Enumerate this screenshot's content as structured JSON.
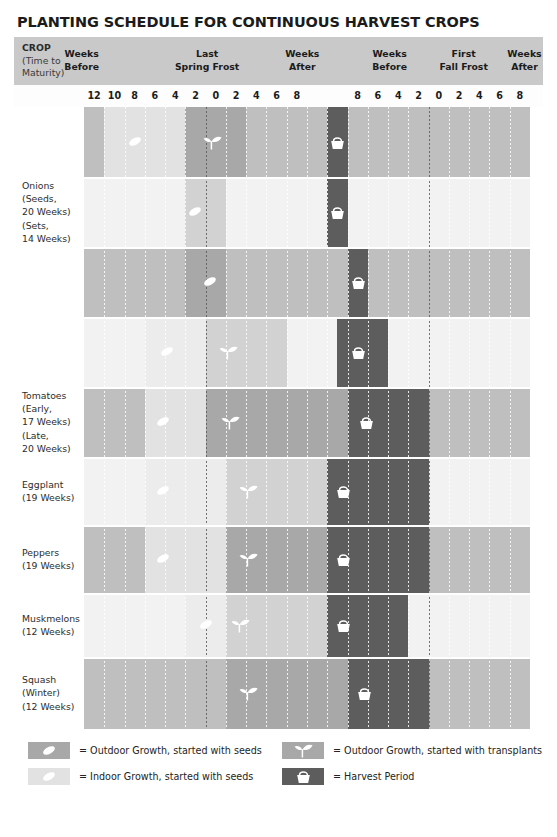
{
  "title": "PLANTING SCHEDULE FOR CONTINUOUS HARVEST CROPS",
  "header": {
    "crop_label": "CROP",
    "crop_sub1": "(Time to",
    "crop_sub2": "Maturity)",
    "groups": [
      {
        "line1": "Weeks",
        "line2": "Before",
        "center_pct": 12.8
      },
      {
        "line1": "Last",
        "line2": "Spring Frost",
        "center_pct": 36.5
      },
      {
        "line1": "Weeks",
        "line2": "After",
        "center_pct": 54.5
      },
      {
        "line1": "Weeks",
        "line2": "Before",
        "center_pct": 71.0
      },
      {
        "line1": "First",
        "line2": "Fall Frost",
        "center_pct": 85.0
      },
      {
        "line1": "Weeks",
        "line2": "After",
        "center_pct": 96.5
      }
    ]
  },
  "axis": {
    "ticks": [
      "12",
      "10",
      "8",
      "6",
      "4",
      "2",
      "0",
      "2",
      "4",
      "6",
      "8",
      "",
      "",
      "8",
      "6",
      "4",
      "2",
      "0",
      "2",
      "4",
      "6",
      "8"
    ],
    "n_columns": 22,
    "frost_columns": [
      6,
      17
    ],
    "frost_labels": [
      "Last Spring Frost",
      "First Fall Frost"
    ]
  },
  "colors": {
    "header_band": "#c9c9c9",
    "base_dark": "#bfbfbf",
    "base_light": "#f2f2f2",
    "outdoor_seeds_dark": "#a8a8a8",
    "outdoor_seeds_light": "#d2d2d2",
    "indoor_seeds_dark": "#e2e2e2",
    "indoor_seeds_light": "#ececec",
    "harvest": "#5d5d5d",
    "text": "#2c2c2c"
  },
  "legend": {
    "items": [
      {
        "swatch": "outdoor-seeds",
        "icon": "seed-icon",
        "text": "= Outdoor Growth, started with seeds"
      },
      {
        "swatch": "outdoor-trans",
        "icon": "sprout-icon",
        "text": "= Outdoor Growth, started with transplants"
      },
      {
        "swatch": "indoor-seeds",
        "icon": "seed-icon",
        "text": "= Indoor Growth, started with seeds"
      },
      {
        "swatch": "harvest",
        "icon": "basket-icon",
        "text": "= Harvest Period"
      }
    ]
  },
  "chart_data": {
    "type": "table",
    "title": "PLANTING SCHEDULE FOR CONTINUOUS HARVEST CROPS",
    "xlabel": "Weeks relative to Last Spring Frost and First Fall Frost",
    "ylabel": "Crop",
    "column_count": 22,
    "tick_labels": [
      "12",
      "10",
      "8",
      "6",
      "4",
      "2",
      "0",
      "2",
      "4",
      "6",
      "8",
      "",
      "",
      "8",
      "6",
      "4",
      "2",
      "0",
      "2",
      "4",
      "6",
      "8"
    ],
    "rows": [
      {
        "crop": "Onions",
        "variant": "(Seeds, 20 Weeks)",
        "label_lines": [],
        "shade": "dark",
        "segments": [
          {
            "type": "indoor-seeds",
            "start": 1,
            "end": 6,
            "icon": "seed-icon",
            "icon_col": 2
          },
          {
            "type": "outdoor-seeds",
            "start": 5,
            "end": 8,
            "icon": "sprout-icon",
            "icon_col": 5.6
          },
          {
            "type": "harvest",
            "start": 12,
            "end": 13,
            "icon": "basket-icon",
            "icon_col": 12
          }
        ]
      },
      {
        "crop": "Onions",
        "variant": "(Sets, 14 Weeks)",
        "label_lines": [
          "Onions",
          "(Seeds,",
          "20 Weeks)",
          "(Sets,",
          "14 Weeks)"
        ],
        "shade": "light",
        "segments": [
          {
            "type": "outdoor-seeds",
            "start": 5,
            "end": 7,
            "icon": "seed-icon",
            "icon_col": 5
          },
          {
            "type": "harvest",
            "start": 12,
            "end": 13,
            "icon": "basket-icon",
            "icon_col": 12
          }
        ]
      },
      {
        "crop": "Onions",
        "variant": "(third)",
        "label_lines": [],
        "shade": "dark",
        "segments": [
          {
            "type": "outdoor-seeds",
            "start": 5,
            "end": 7,
            "icon": "seed-icon",
            "icon_col": 5.7
          },
          {
            "type": "harvest",
            "start": 13,
            "end": 14,
            "icon": "basket-icon",
            "icon_col": 13
          }
        ]
      },
      {
        "crop": "Tomatoes",
        "variant": "(Early, 17 Weeks)",
        "label_lines": [],
        "shade": "light",
        "segments": [
          {
            "type": "indoor-seeds",
            "start": 3,
            "end": 6,
            "icon": "seed-icon",
            "icon_col": 3.6
          },
          {
            "type": "outdoor-seeds",
            "start": 6,
            "end": 10,
            "icon": "sprout-icon",
            "icon_col": 6.4
          },
          {
            "type": "harvest",
            "start": 12.5,
            "end": 15,
            "icon": "basket-icon",
            "icon_col": 13
          }
        ]
      },
      {
        "crop": "Tomatoes",
        "variant": "(Late, 20 Weeks)",
        "label_lines": [
          "Tomatoes",
          "(Early,",
          "17 Weeks)",
          "(Late,",
          "20 Weeks)"
        ],
        "shade": "dark",
        "segments": [
          {
            "type": "indoor-seeds",
            "start": 3,
            "end": 6,
            "icon": "seed-icon",
            "icon_col": 3.4
          },
          {
            "type": "outdoor-seeds",
            "start": 6,
            "end": 13,
            "icon": "sprout-icon",
            "icon_col": 6.5
          },
          {
            "type": "harvest",
            "start": 13,
            "end": 17,
            "icon": "basket-icon",
            "icon_col": 13.4
          }
        ]
      },
      {
        "crop": "Eggplant",
        "variant": "(19 Weeks)",
        "label_lines": [
          "Eggplant",
          "(19 Weeks)"
        ],
        "shade": "light",
        "segments": [
          {
            "type": "indoor-seeds",
            "start": 3,
            "end": 7,
            "icon": "seed-icon",
            "icon_col": 3.4
          },
          {
            "type": "outdoor-seeds",
            "start": 7,
            "end": 12,
            "icon": "sprout-icon",
            "icon_col": 7.4
          },
          {
            "type": "harvest",
            "start": 12,
            "end": 17,
            "icon": "basket-icon",
            "icon_col": 12.3
          }
        ]
      },
      {
        "crop": "Peppers",
        "variant": "(19 Weeks)",
        "label_lines": [
          "Peppers",
          "(19 Weeks)"
        ],
        "shade": "dark",
        "segments": [
          {
            "type": "indoor-seeds",
            "start": 3,
            "end": 7,
            "icon": "seed-icon",
            "icon_col": 3.4
          },
          {
            "type": "outdoor-seeds",
            "start": 7,
            "end": 12,
            "icon": "sprout-icon",
            "icon_col": 7.4
          },
          {
            "type": "harvest",
            "start": 12,
            "end": 17,
            "icon": "basket-icon",
            "icon_col": 12.3
          }
        ]
      },
      {
        "crop": "Muskmelons",
        "variant": "(12 Weeks)",
        "label_lines": [
          "Muskmelons",
          "(12 Weeks)"
        ],
        "shade": "light",
        "segments": [
          {
            "type": "indoor-seeds",
            "start": 5,
            "end": 7,
            "icon": "seed-icon",
            "icon_col": 5.5
          },
          {
            "type": "outdoor-seeds",
            "start": 7,
            "end": 12,
            "icon": "sprout-icon",
            "icon_col": 7.0
          },
          {
            "type": "harvest",
            "start": 12,
            "end": 16,
            "icon": "basket-icon",
            "icon_col": 12.3
          }
        ]
      },
      {
        "crop": "Squash",
        "variant": "(Winter, 12 Weeks)",
        "label_lines": [
          "Squash",
          "(Winter)",
          "(12 Weeks)"
        ],
        "shade": "dark",
        "segments": [
          {
            "type": "outdoor-seeds",
            "start": 7,
            "end": 13,
            "icon": "sprout-icon",
            "icon_col": 7.4
          },
          {
            "type": "harvest",
            "start": 13,
            "end": 17,
            "icon": "basket-icon",
            "icon_col": 13.3
          }
        ]
      }
    ]
  }
}
